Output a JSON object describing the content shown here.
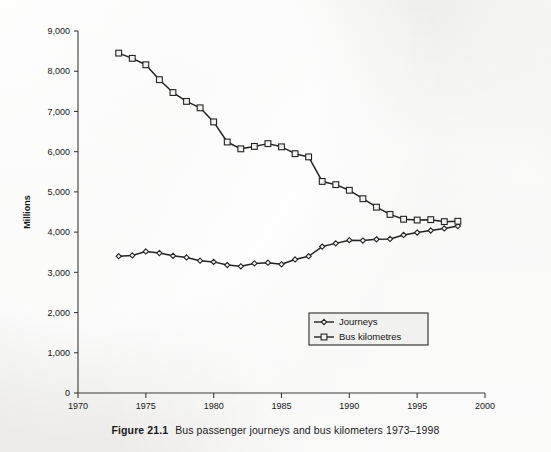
{
  "figure": {
    "caption_label": "Figure 21.1",
    "caption_text": "Bus passenger journeys and bus kilometers 1973–1998"
  },
  "colors": {
    "background": "#f2f2f0",
    "ink": "#232323",
    "axis": "#3b3b3b",
    "marker_fill": "#f3f3f1"
  },
  "chart_data": {
    "type": "line",
    "title": "Bus passenger journeys and bus kilometers 1973–1998",
    "xlabel": "",
    "ylabel": "Millions",
    "xlim": [
      1970,
      2000
    ],
    "ylim": [
      0,
      9000
    ],
    "xticks": [
      1970,
      1975,
      1980,
      1985,
      1990,
      1995,
      2000
    ],
    "xtick_labels": [
      "1970",
      "1975",
      "1980",
      "1985",
      "1990",
      "1995",
      "2000"
    ],
    "yticks": [
      0,
      1000,
      2000,
      3000,
      4000,
      5000,
      6000,
      7000,
      8000,
      9000
    ],
    "ytick_labels": [
      "0",
      "1,000",
      "2,000",
      "3,000",
      "4,000",
      "5,000",
      "6,000",
      "7,000",
      "8,000",
      "9,000"
    ],
    "grid": false,
    "legend_position": "lower right",
    "x": [
      1973,
      1974,
      1975,
      1976,
      1977,
      1978,
      1979,
      1980,
      1981,
      1982,
      1983,
      1984,
      1985,
      1986,
      1987,
      1988,
      1989,
      1990,
      1991,
      1992,
      1993,
      1994,
      1995,
      1996,
      1997,
      1998
    ],
    "series": [
      {
        "name": "Journeys",
        "marker": "diamond",
        "values": [
          3400,
          3420,
          3520,
          3480,
          3410,
          3370,
          3290,
          3260,
          3180,
          3150,
          3220,
          3240,
          3200,
          3320,
          3400,
          3640,
          3720,
          3800,
          3790,
          3820,
          3830,
          3930,
          3990,
          4040,
          4090,
          4150
        ]
      },
      {
        "name": "Bus kilometres",
        "marker": "square",
        "values": [
          8450,
          8320,
          8160,
          7790,
          7470,
          7250,
          7090,
          6740,
          6240,
          6070,
          6130,
          6200,
          6120,
          5950,
          5870,
          5260,
          5180,
          5040,
          4830,
          4620,
          4440,
          4320,
          4300,
          4310,
          4260,
          4270
        ]
      }
    ]
  },
  "legend": {
    "entries": [
      {
        "label": "Journeys",
        "marker": "diamond"
      },
      {
        "label": "Bus kilometres",
        "marker": "square"
      }
    ]
  }
}
